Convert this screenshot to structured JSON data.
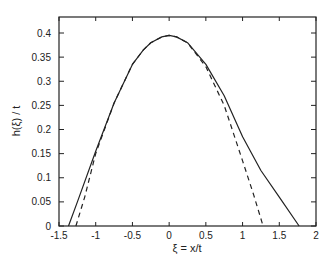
{
  "chart_data": {
    "type": "line",
    "title": "",
    "xlabel": "ξ = x/t",
    "ylabel": "h(ξ) / t",
    "xlim": [
      -1.5,
      2
    ],
    "ylim": [
      0,
      0.43
    ],
    "grid": false,
    "legend": null,
    "x_ticks": [
      -1.5,
      -1,
      -0.5,
      0,
      0.5,
      1,
      1.5,
      2
    ],
    "x_tick_labels": [
      "-1.5",
      "-1",
      "-0.5",
      "0",
      "0.5",
      "1",
      "1.5",
      "2"
    ],
    "y_ticks": [
      0,
      0.05,
      0.1,
      0.15,
      0.2,
      0.25,
      0.3,
      0.35,
      0.4
    ],
    "y_tick_labels": [
      "0",
      "0.05",
      "0.1",
      "0.15",
      "0.2",
      "0.25",
      "0.3",
      "0.35",
      "0.4"
    ],
    "series": [
      {
        "name": "solid",
        "style": "solid",
        "x": [
          -1.37,
          -1.25,
          -1.0,
          -0.75,
          -0.5,
          -0.35,
          -0.25,
          -0.1,
          0.0,
          0.1,
          0.25,
          0.5,
          0.75,
          1.0,
          1.25,
          1.5,
          1.77
        ],
        "y": [
          0.0,
          0.05,
          0.155,
          0.255,
          0.335,
          0.365,
          0.38,
          0.392,
          0.395,
          0.392,
          0.38,
          0.335,
          0.27,
          0.185,
          0.115,
          0.06,
          0.0
        ]
      },
      {
        "name": "dashed",
        "style": "dashed",
        "x": [
          -1.27,
          -1.15,
          -1.0,
          -0.75,
          -0.5,
          -0.35,
          -0.25,
          -0.1,
          0.0,
          0.1,
          0.25,
          0.5,
          0.75,
          1.0,
          1.15,
          1.28
        ],
        "y": [
          0.0,
          0.06,
          0.15,
          0.255,
          0.335,
          0.365,
          0.38,
          0.392,
          0.395,
          0.392,
          0.38,
          0.33,
          0.25,
          0.135,
          0.065,
          0.0
        ]
      }
    ]
  },
  "colors": {
    "line": "#222222",
    "background": "#ffffff"
  }
}
